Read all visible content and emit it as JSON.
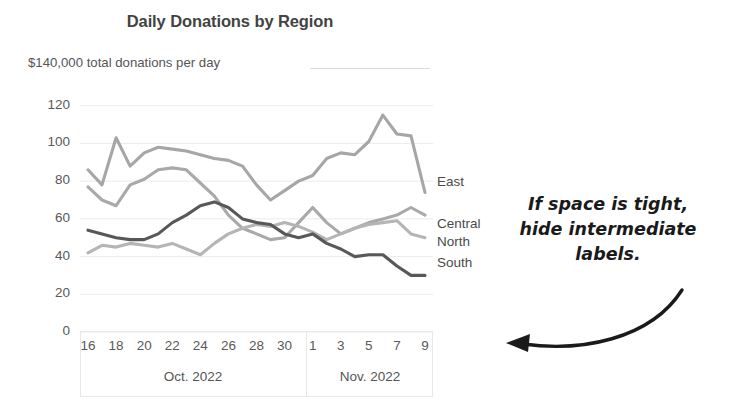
{
  "chart_data": {
    "type": "line",
    "title": "Daily Donations by Region",
    "subtitle": "$140,000 total donations per day",
    "xlabel": "",
    "ylabel": "",
    "ylim": [
      0,
      140
    ],
    "yticks": [
      120,
      100,
      80,
      60,
      40,
      20,
      0
    ],
    "grid": true,
    "legend_position": "right-inline-labels",
    "x": [
      16,
      17,
      18,
      19,
      20,
      21,
      22,
      23,
      24,
      25,
      26,
      27,
      28,
      29,
      30,
      31,
      1,
      2,
      3,
      4,
      5,
      6,
      7,
      8,
      9
    ],
    "xtick_labels": [
      "16",
      "18",
      "20",
      "22",
      "24",
      "26",
      "28",
      "30",
      "1",
      "3",
      "5",
      "7",
      "9"
    ],
    "xtick_values": [
      16,
      18,
      20,
      22,
      24,
      26,
      28,
      30,
      1,
      3,
      5,
      7,
      9
    ],
    "periods": [
      {
        "label": "Oct. 2022",
        "start": 16,
        "end": 31
      },
      {
        "label": "Nov. 2022",
        "start": 1,
        "end": 9
      }
    ],
    "series": [
      {
        "name": "East",
        "color": "#a6a6a6",
        "values": [
          86,
          78,
          103,
          88,
          95,
          98,
          97,
          96,
          94,
          92,
          91,
          88,
          78,
          70,
          75,
          80,
          83,
          92,
          95,
          94,
          101,
          115,
          105,
          104,
          74
        ]
      },
      {
        "name": "Central",
        "color": "#a9a9a9",
        "values": [
          77,
          70,
          67,
          78,
          81,
          86,
          87,
          86,
          79,
          72,
          62,
          55,
          52,
          49,
          50,
          58,
          66,
          58,
          52,
          55,
          58,
          60,
          62,
          66,
          62
        ]
      },
      {
        "name": "North",
        "color": "#b5b5b5",
        "values": [
          42,
          46,
          45,
          47,
          46,
          45,
          47,
          44,
          41,
          47,
          52,
          55,
          57,
          56,
          58,
          56,
          53,
          49,
          52,
          55,
          57,
          58,
          59,
          52,
          50
        ]
      },
      {
        "name": "South",
        "color": "#585858",
        "values": [
          54,
          52,
          50,
          49,
          49,
          52,
          58,
          62,
          67,
          69,
          66,
          60,
          58,
          57,
          52,
          50,
          52,
          47,
          44,
          40,
          41,
          41,
          35,
          30,
          30
        ]
      }
    ],
    "annotation": {
      "text": "If space is tight, hide intermediate labels.",
      "lines": [
        "If space is tight,",
        "hide intermediate",
        "labels."
      ],
      "pointer": "curved-arrow-left"
    }
  }
}
